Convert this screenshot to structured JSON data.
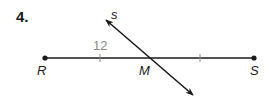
{
  "problem": {
    "number": "4."
  },
  "diagram": {
    "segment": {
      "start_label": "R",
      "end_label": "S"
    },
    "midpoint_label": "M",
    "line_label": "s",
    "measure_label": "12",
    "colors": {
      "stroke": "#1a1a1a",
      "measure": "#8a8a8a"
    }
  }
}
